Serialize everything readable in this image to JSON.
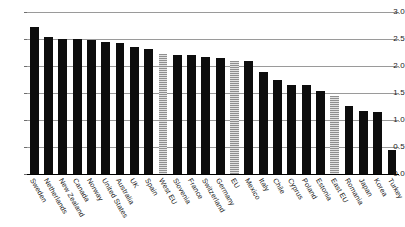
{
  "chart_data": {
    "type": "bar",
    "title": "",
    "xlabel": "",
    "ylabel": "",
    "ylim": [
      0.0,
      3.0
    ],
    "grid": true,
    "legend": "none",
    "yticks": [
      "0.0",
      "0.5",
      "1.0",
      "1.5",
      "2.0",
      "2.5",
      "3.0"
    ],
    "ytick_values": [
      0.0,
      0.5,
      1.0,
      1.5,
      2.0,
      2.5,
      3.0
    ],
    "categories": [
      "Sweden",
      "Netherlands",
      "New Zealand",
      "Canada",
      "Norway",
      "United States",
      "Australia",
      "UK",
      "Spain",
      "West EU",
      "Slovenia",
      "France",
      "Switzerland",
      "Germany",
      "EU",
      "Mexico",
      "Italy",
      "Chile",
      "Cyprus",
      "Poland",
      "Estonia",
      "East EU",
      "Romania",
      "Japan",
      "Korea",
      "Turkey"
    ],
    "values": [
      2.72,
      2.53,
      2.5,
      2.5,
      2.48,
      2.45,
      2.43,
      2.36,
      2.31,
      2.22,
      2.21,
      2.21,
      2.17,
      2.14,
      2.1,
      2.09,
      1.88,
      1.75,
      1.65,
      1.64,
      1.53,
      1.45,
      1.26,
      1.16,
      1.14,
      0.45
    ],
    "styles": [
      "solid",
      "solid",
      "solid",
      "solid",
      "solid",
      "solid",
      "solid",
      "solid",
      "solid",
      "aggregate",
      "solid",
      "solid",
      "solid",
      "solid",
      "aggregate",
      "solid",
      "solid",
      "solid",
      "solid",
      "solid",
      "solid",
      "aggregate",
      "solid",
      "solid",
      "solid",
      "solid"
    ],
    "colors": {
      "bar": "#0d0d0d",
      "aggregate_bar": "#b9b9b9",
      "gridline": "#9a9a9a",
      "axis": "#000000",
      "text": "#1a1a1a",
      "background": "#ffffff"
    }
  }
}
